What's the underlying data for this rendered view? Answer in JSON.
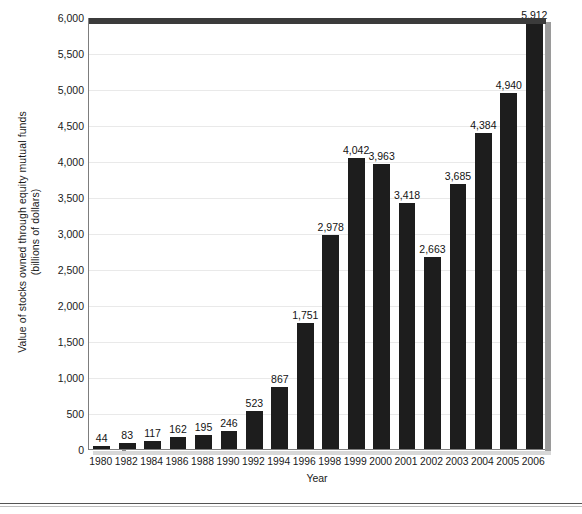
{
  "chart_data": {
    "type": "bar",
    "title": "",
    "subtitle": "",
    "xlabel": "Year",
    "ylabel": "Value of stocks owned through equity mutual funds\n(billions of dollars)",
    "ylabel_line1": "Value of stocks owned through equity mutual funds",
    "ylabel_line2": "(billions of dollars)",
    "categories": [
      "1980",
      "1982",
      "1984",
      "1986",
      "1988",
      "1990",
      "1992",
      "1994",
      "1996",
      "1998",
      "1999",
      "2000",
      "2001",
      "2002",
      "2003",
      "2004",
      "2005",
      "2006"
    ],
    "values": [
      44,
      83,
      117,
      162,
      195,
      246,
      523,
      867,
      1751,
      2978,
      4042,
      3963,
      3418,
      2663,
      3685,
      4384,
      4940,
      5912
    ],
    "value_labels": [
      "44",
      "83",
      "117",
      "162",
      "195",
      "246",
      "523",
      "867",
      "1,751",
      "2,978",
      "4,042",
      "3,963",
      "3,418",
      "2,663",
      "3,685",
      "4,384",
      "4,940",
      "5,912"
    ],
    "ylim": [
      0,
      6000
    ],
    "yticks": [
      0,
      500,
      1000,
      1500,
      2000,
      2500,
      3000,
      3500,
      4000,
      4500,
      5000,
      5500,
      6000
    ],
    "ytick_labels": [
      "0",
      "500",
      "1,000",
      "1,500",
      "2,000",
      "2,500",
      "3,000",
      "3,500",
      "4,000",
      "4,500",
      "5,000",
      "5,500",
      "6,000"
    ],
    "grid": true,
    "grid_axis": "y",
    "legend": false,
    "legend_position": "none",
    "bar_color": "#1d1d1d",
    "grid_color": "#e9e9e9",
    "axis_color": "#7d7d7d",
    "background_color": "#ffffff",
    "text_color": "#1a1a1a"
  }
}
